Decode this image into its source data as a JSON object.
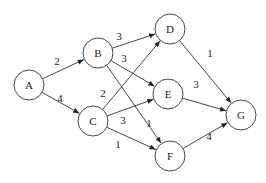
{
  "graph": {
    "directed": true,
    "node_radius": 15,
    "stroke_color": "#333333",
    "fill_color": "#ffffff",
    "nodes": [
      {
        "id": "A",
        "label": "A",
        "x": 29,
        "y": 85
      },
      {
        "id": "B",
        "label": "B",
        "x": 98,
        "y": 53
      },
      {
        "id": "C",
        "label": "C",
        "x": 93,
        "y": 121
      },
      {
        "id": "D",
        "label": "D",
        "x": 170,
        "y": 29
      },
      {
        "id": "E",
        "label": "E",
        "x": 168,
        "y": 94
      },
      {
        "id": "F",
        "label": "F",
        "x": 170,
        "y": 156
      },
      {
        "id": "G",
        "label": "G",
        "x": 241,
        "y": 115
      }
    ],
    "edges": [
      {
        "from": "A",
        "to": "B",
        "weight": "2",
        "lx": 57,
        "ly": 62
      },
      {
        "from": "A",
        "to": "C",
        "weight": "4",
        "lx": 60,
        "ly": 99
      },
      {
        "from": "B",
        "to": "D",
        "weight": "3",
        "lx": 119,
        "ly": 37
      },
      {
        "from": "B",
        "to": "E",
        "weight": "3",
        "lx": 124,
        "ly": 59
      },
      {
        "from": "B",
        "to": "F",
        "weight": "1",
        "lx": 149,
        "ly": 124
      },
      {
        "from": "C",
        "to": "D",
        "weight": "2",
        "lx": 103,
        "ly": 94
      },
      {
        "from": "C",
        "to": "E",
        "weight": "3",
        "lx": 123,
        "ly": 121
      },
      {
        "from": "C",
        "to": "F",
        "weight": "1",
        "lx": 118,
        "ly": 145
      },
      {
        "from": "D",
        "to": "G",
        "weight": "1",
        "lx": 210,
        "ly": 54
      },
      {
        "from": "E",
        "to": "G",
        "weight": "3",
        "lx": 196,
        "ly": 85
      },
      {
        "from": "F",
        "to": "G",
        "weight": "4",
        "lx": 209,
        "ly": 137
      }
    ]
  }
}
